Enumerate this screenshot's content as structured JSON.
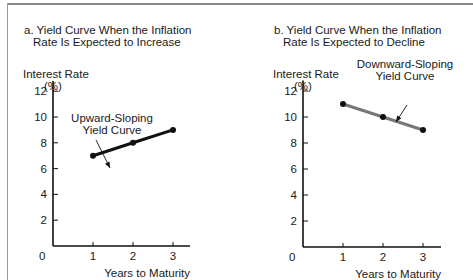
{
  "chart_data": [
    {
      "type": "line",
      "panel": "a",
      "title": "a. Yield Curve When the Inflation Rate Is Expected to Increase",
      "title_lines": [
        "a. Yield Curve When the Inflation",
        "Rate Is Expected to Increase"
      ],
      "xlabel": "Years to Maturity",
      "ylabel": "Interest Rate (%)",
      "ylabel_lines": [
        "Interest Rate",
        "(%)"
      ],
      "x": [
        1,
        2,
        3
      ],
      "values": [
        7,
        8,
        9
      ],
      "xticks": [
        "0",
        "1",
        "2",
        "3"
      ],
      "yticks": [
        "2",
        "4",
        "6",
        "8",
        "10",
        "12"
      ],
      "ylim": [
        0,
        12
      ],
      "xlim": [
        0,
        3.5
      ],
      "grid": false,
      "annotation": [
        "Upward-Sloping",
        "Yield Curve"
      ],
      "line_color": "#111111"
    },
    {
      "type": "line",
      "panel": "b",
      "title": "b. Yield Curve When the Inflation Rate Is Expected to Decline",
      "title_lines": [
        "b. Yield Curve When the Inflation",
        "Rate Is Expected to Decline"
      ],
      "xlabel": "Years to Maturity",
      "ylabel": "Interest Rate (%)",
      "ylabel_lines": [
        "Interest Rate",
        "(%)"
      ],
      "x": [
        1,
        2,
        3
      ],
      "values": [
        11,
        10,
        9
      ],
      "xticks": [
        "0",
        "1",
        "2",
        "3"
      ],
      "yticks": [
        "2",
        "4",
        "6",
        "8",
        "10",
        "12"
      ],
      "ylim": [
        0,
        12
      ],
      "xlim": [
        0,
        3.5
      ],
      "grid": false,
      "annotation": [
        "Downward-Sloping",
        "Yield Curve"
      ],
      "line_color": "#777777"
    }
  ]
}
